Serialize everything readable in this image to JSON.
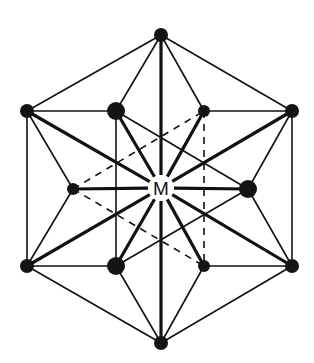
{
  "diagram": {
    "title": "",
    "center_label": "M",
    "center": {
      "x": 161,
      "y": 188
    },
    "colors": {
      "line": "#111111",
      "atom": "#141414",
      "background": "#ffffff"
    },
    "nodes": [
      {
        "id": "top",
        "x": 161,
        "y": 35,
        "r": 7
      },
      {
        "id": "ul",
        "x": 27,
        "y": 111,
        "r": 7
      },
      {
        "id": "uml",
        "x": 116,
        "y": 111,
        "r": 9
      },
      {
        "id": "umr",
        "x": 204,
        "y": 111,
        "r": 6
      },
      {
        "id": "ur",
        "x": 292,
        "y": 111,
        "r": 7
      },
      {
        "id": "ml",
        "x": 73,
        "y": 189,
        "r": 6
      },
      {
        "id": "mr",
        "x": 248,
        "y": 189,
        "r": 9
      },
      {
        "id": "ll",
        "x": 27,
        "y": 266,
        "r": 7
      },
      {
        "id": "lml",
        "x": 116,
        "y": 266,
        "r": 9
      },
      {
        "id": "lmr",
        "x": 204,
        "y": 266,
        "r": 6
      },
      {
        "id": "lr",
        "x": 292,
        "y": 266,
        "r": 7
      },
      {
        "id": "bottom",
        "x": 161,
        "y": 343,
        "r": 7
      }
    ],
    "edges_thin": [
      [
        "top",
        "ul"
      ],
      [
        "top",
        "ur"
      ],
      [
        "top",
        "uml"
      ],
      [
        "top",
        "umr"
      ],
      [
        "ul",
        "uml"
      ],
      [
        "umr",
        "ur"
      ],
      [
        "ul",
        "ll"
      ],
      [
        "ur",
        "lr"
      ],
      [
        "ul",
        "ml"
      ],
      [
        "ml",
        "ll"
      ],
      [
        "ur",
        "mr"
      ],
      [
        "mr",
        "lr"
      ],
      [
        "ll",
        "lml"
      ],
      [
        "lmr",
        "lr"
      ],
      [
        "ll",
        "bottom"
      ],
      [
        "lr",
        "bottom"
      ],
      [
        "lml",
        "bottom"
      ],
      [
        "lmr",
        "bottom"
      ],
      [
        "uml",
        "lml"
      ],
      [
        "uml",
        "mr"
      ],
      [
        "lml",
        "mr"
      ],
      [
        "ml",
        "umr"
      ],
      [
        "ml",
        "lmr"
      ],
      [
        "umr",
        "lmr"
      ]
    ],
    "edges_bond": [
      [
        "top",
        "center"
      ],
      [
        "bottom",
        "center"
      ],
      [
        "ul",
        "center"
      ],
      [
        "ur",
        "center"
      ],
      [
        "ll",
        "center"
      ],
      [
        "lr",
        "center"
      ],
      [
        "uml",
        "center"
      ],
      [
        "lml",
        "center"
      ],
      [
        "umr",
        "center"
      ],
      [
        "lmr",
        "center"
      ],
      [
        "ml",
        "center"
      ],
      [
        "mr",
        "center"
      ]
    ],
    "hidden_edges": [
      [
        "ml",
        "umr"
      ],
      [
        "ml",
        "lmr"
      ],
      [
        "umr",
        "lmr"
      ]
    ]
  }
}
